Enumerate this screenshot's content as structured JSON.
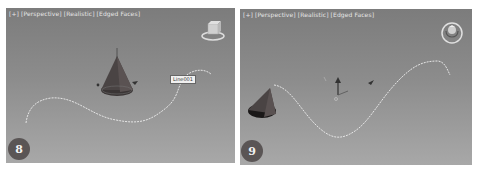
{
  "panels": [
    {
      "id": "viewport-8",
      "label": "[+] [Perspective] [Realistic] [Edged Faces]",
      "step_badge": "8",
      "tooltip": "Line001",
      "objects": [
        "cone",
        "spline-path",
        "viewcube"
      ]
    },
    {
      "id": "viewport-9",
      "label": "[+] [Perspective] [Realistic] [Edged Faces]",
      "step_badge": "9",
      "objects": [
        "cone",
        "spline-path",
        "transform-gizmo",
        "viewcube"
      ]
    }
  ],
  "colors": {
    "viewport_top": "#7c7c7c",
    "viewport_bottom": "#a8a8a8",
    "spline": "#e8e8e8",
    "cone_dark": "#2e2a2a",
    "badge": "#5a5555"
  }
}
